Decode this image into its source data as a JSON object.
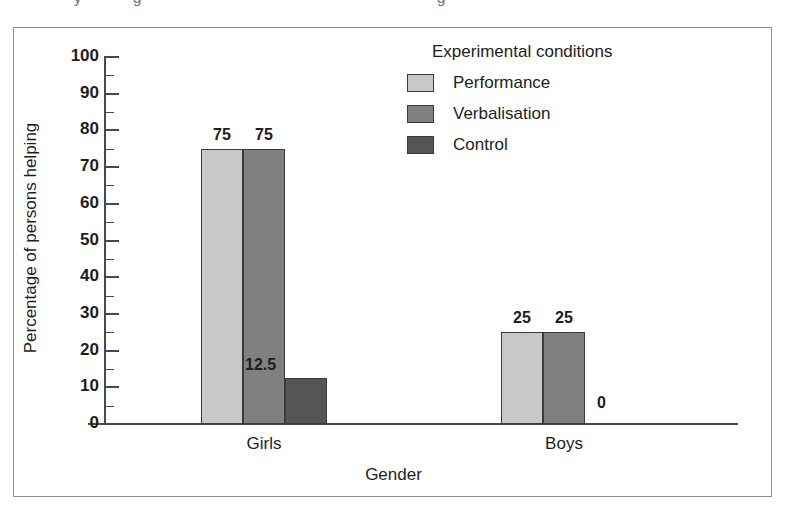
{
  "figure": {
    "top_cut_fragments": [
      "y",
      "g",
      "g"
    ]
  },
  "chart_data": {
    "type": "bar",
    "title": "",
    "xlabel": "Gender",
    "ylabel": "Percentage of persons helping",
    "categories": [
      "Girls",
      "Boys"
    ],
    "series": [
      {
        "name": "Performance",
        "color": "#c8c8c8",
        "values": [
          75,
          25
        ]
      },
      {
        "name": "Verbalisation",
        "color": "#808080",
        "values": [
          75,
          25
        ]
      },
      {
        "name": "Control",
        "color": "#555555",
        "values": [
          12.5,
          0
        ]
      }
    ],
    "value_labels": {
      "girls": [
        "75",
        "75",
        "12.5"
      ],
      "boys": [
        "25",
        "25",
        "0"
      ]
    },
    "ylim": [
      0,
      100
    ],
    "ytick_labels": [
      "0",
      "10",
      "20",
      "30",
      "40",
      "50",
      "60",
      "70",
      "80",
      "90",
      "100"
    ],
    "ytick_step": 10,
    "minor_tick_step": 5,
    "grid": false,
    "legend_position": "top-right",
    "legend_title": "Experimental conditions"
  }
}
